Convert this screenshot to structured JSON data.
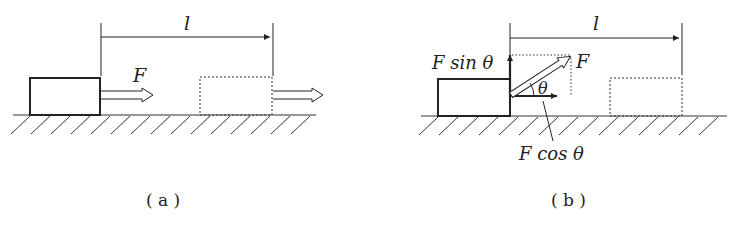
{
  "panels": {
    "a": {
      "caption": "( a )",
      "force_label": "F",
      "distance_label": "l"
    },
    "b": {
      "caption": "( b )",
      "force_label": "F",
      "distance_label": "l",
      "vertical_component_label": "F sin θ",
      "horizontal_component_label": "F cos θ",
      "angle_label": "θ"
    }
  },
  "colors": {
    "ink": "#222222",
    "background": "#ffffff"
  }
}
